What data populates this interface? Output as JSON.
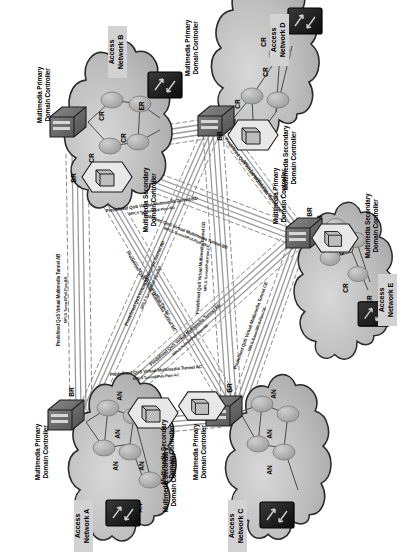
{
  "figure": {
    "orientation": "rotated-90-ccw",
    "palette": {
      "cloud_fill": "#b9b9b9",
      "cloud_fill_light": "#cdcdcd",
      "cloud_stroke": "#2a2a2a",
      "router_fill": "#9a9a9a",
      "er_fill": "#141414",
      "link_stroke": "#4a4a4a",
      "tunnel_solid": "#9b9b9b",
      "tunnel_dash": "#6e6e6e",
      "label_box": "#d2d2d2",
      "text": "#000000"
    }
  },
  "networks": [
    {
      "id": "A",
      "name_line1": "Access",
      "name_line2": "Network A",
      "primary_controller_line1": "Multimedia Primary",
      "primary_controller_line2": "Domain Controller",
      "secondary_controller_line1": "Multimedia Secondary",
      "secondary_controller_line2": "Domain Controller",
      "core_node_type": "AN",
      "nodes": [
        "AN",
        "AN",
        "AN",
        "AN",
        "AN"
      ],
      "edge_router": "AN",
      "border_router": "BR"
    },
    {
      "id": "B",
      "name_line1": "Access",
      "name_line2": "Network B",
      "primary_controller_line1": "Multimedia Primary",
      "primary_controller_line2": "Domain Controller",
      "secondary_controller_line1": "Multimedia Secondary",
      "secondary_controller_line2": "Domain Controller",
      "core_node_type": "CR",
      "nodes": [
        "CR",
        "CR",
        "CR"
      ],
      "edge_router": "ER",
      "border_router": "BR"
    },
    {
      "id": "C",
      "name_line1": "Access",
      "name_line2": "Network C",
      "primary_controller_line1": "Multimedia Primary",
      "primary_controller_line2": "Domain Controller",
      "secondary_controller_line1": "Multimedia Secondary",
      "secondary_controller_line2": "Domain Controller",
      "core_node_type": "AN",
      "nodes": [
        "AN",
        "AN",
        "AN",
        "AN"
      ],
      "edge_router": "AN",
      "border_router": "BR"
    },
    {
      "id": "D",
      "name_line1": "Access",
      "name_line2": "Network D",
      "primary_controller_line1": "Multimedia Primary",
      "primary_controller_line2": "Domain Controller",
      "secondary_controller_line1": "Multimedia Secondary",
      "secondary_controller_line2": "Domain Controller",
      "core_node_type": "CR",
      "nodes": [
        "CR",
        "CR",
        "CR"
      ],
      "edge_router": "ER",
      "border_router": "BR"
    },
    {
      "id": "E",
      "name_line1": "Access",
      "name_line2": "Network E",
      "primary_controller_line1": "Multimedia Primary",
      "primary_controller_line2": "Domain Controller",
      "secondary_controller_line1": "Multimedia Secondary",
      "secondary_controller_line2": "Domain Controller",
      "core_node_type": "CR",
      "nodes": [
        "CR",
        "CR",
        "CR",
        "CR"
      ],
      "edge_router": "ER",
      "border_router": "BR"
    }
  ],
  "tunnels": [
    {
      "id": "AB",
      "label": "Predefined QoS Virtual Multimedia Tunnel AB",
      "sublabel": "MPLS Tunnel/IPv6-Pipe-AB",
      "from": "A",
      "to": "B"
    },
    {
      "id": "AC",
      "label": "Predefined QoS Virtual Multimedia Tunnel AC",
      "sublabel": "MPLS Tunnel/IPv6-Pipe-AC",
      "from": "A",
      "to": "C"
    },
    {
      "id": "AD",
      "label": "Predefined QoS Virtual Multimedia Tunnel AD",
      "sublabel": "MPLS Tunnel/IPv6-Pipe-AD",
      "from": "A",
      "to": "D"
    },
    {
      "id": "AE",
      "label": "Predefined QoS Virtual Multimedia Tunnel AE",
      "sublabel": "MPLS Tunnel/IPv6-Pipe-AE",
      "from": "A",
      "to": "E"
    },
    {
      "id": "BC",
      "label": "Predefined QoS Virtual Multimedia Tunnel BC",
      "sublabel": "MPLS-Tunnel/IPv6-Pipe-BC",
      "from": "B",
      "to": "C"
    },
    {
      "id": "BD",
      "label": "Predefined QoS Virtual Multimedia Tunnel BD",
      "sublabel": "MPLS Tunnel/IPv6-Pipe-BD",
      "from": "B",
      "to": "D"
    },
    {
      "id": "BE",
      "label": "Predefined QoS Virtual Multimedia Tunnel BE",
      "sublabel": "MPLS-Tunnel/IPv6-Pipe-BE",
      "from": "B",
      "to": "E"
    },
    {
      "id": "CD",
      "label": "Predefined QoS Virtual Multimedia Tunnel CD",
      "sublabel": "MPLS-Tunnel/IPv6-Pipe-CD",
      "from": "C",
      "to": "D"
    },
    {
      "id": "CE",
      "label": "Predefined QoS Virtual Multimedia Tunnel CE",
      "sublabel": "MPLS-Tunnel/IPv6-Pipe-CE",
      "from": "C",
      "to": "E"
    },
    {
      "id": "DE",
      "label": "Predefined QoS Virtual Multimedia Tunnel DE",
      "sublabel": "MPLS-Tunnel/IPv6-Pipe-DE",
      "from": "D",
      "to": "E"
    }
  ]
}
